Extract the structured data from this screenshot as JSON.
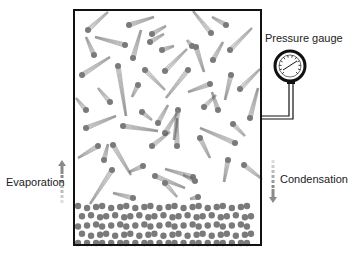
{
  "labels": {
    "pressure_gauge": "Pressure gauge",
    "evaporation": "Evaporation",
    "condensation": "Condensation"
  },
  "colors": {
    "molecule": "#7a7a7a",
    "outline": "#111111",
    "trail": "#555555",
    "arrow": "#8a8a8a",
    "background": "#ffffff"
  },
  "container": {
    "x": 74,
    "y": 10,
    "width": 187,
    "height": 235
  },
  "gauge": {
    "cx": 290,
    "cy": 66,
    "r": 15,
    "pipe_x": 291,
    "pipe_bottom_y": 118
  },
  "arrows": {
    "evaporation": {
      "x": 62,
      "y_top": 160,
      "y_bottom": 208,
      "direction": "up"
    },
    "condensation": {
      "x": 273,
      "y_top": 153,
      "y_bottom": 203,
      "direction": "down"
    }
  },
  "vapor_molecules": [
    {
      "x": 88,
      "y": 30,
      "dx": 20,
      "dy": -18
    },
    {
      "x": 129,
      "y": 25,
      "dx": 25,
      "dy": -8
    },
    {
      "x": 152,
      "y": 34,
      "dx": 14,
      "dy": -8
    },
    {
      "x": 150,
      "y": 42,
      "dx": 14,
      "dy": -8
    },
    {
      "x": 211,
      "y": 33,
      "dx": -18,
      "dy": -22
    },
    {
      "x": 226,
      "y": 25,
      "dx": -14,
      "dy": -8
    },
    {
      "x": 94,
      "y": 55,
      "dx": -8,
      "dy": -18
    },
    {
      "x": 125,
      "y": 45,
      "dx": -30,
      "dy": -8
    },
    {
      "x": 133,
      "y": 58,
      "dx": 8,
      "dy": -28
    },
    {
      "x": 162,
      "y": 50,
      "dx": 12,
      "dy": -4
    },
    {
      "x": 192,
      "y": 46,
      "dx": -5,
      "dy": -6
    },
    {
      "x": 165,
      "y": 71,
      "dx": 22,
      "dy": -22
    },
    {
      "x": 196,
      "y": 47,
      "dx": 8,
      "dy": 25
    },
    {
      "x": 213,
      "y": 60,
      "dx": 10,
      "dy": -18
    },
    {
      "x": 230,
      "y": 50,
      "dx": 22,
      "dy": -22
    },
    {
      "x": 82,
      "y": 75,
      "dx": 28,
      "dy": -18
    },
    {
      "x": 118,
      "y": 66,
      "dx": 8,
      "dy": 50
    },
    {
      "x": 145,
      "y": 70,
      "dx": 20,
      "dy": 20
    },
    {
      "x": 188,
      "y": 70,
      "dx": -22,
      "dy": 28
    },
    {
      "x": 210,
      "y": 84,
      "dx": -22,
      "dy": 8
    },
    {
      "x": 231,
      "y": 75,
      "dx": -6,
      "dy": 25
    },
    {
      "x": 240,
      "y": 89,
      "dx": 20,
      "dy": -20
    },
    {
      "x": 138,
      "y": 85,
      "dx": -6,
      "dy": 12
    },
    {
      "x": 110,
      "y": 102,
      "dx": -12,
      "dy": -14
    },
    {
      "x": 86,
      "y": 110,
      "dx": -10,
      "dy": -12
    },
    {
      "x": 142,
      "y": 112,
      "dx": 10,
      "dy": 8
    },
    {
      "x": 158,
      "y": 123,
      "dx": 10,
      "dy": -18
    },
    {
      "x": 178,
      "y": 110,
      "dx": -4,
      "dy": 30
    },
    {
      "x": 204,
      "y": 107,
      "dx": 12,
      "dy": -12
    },
    {
      "x": 218,
      "y": 110,
      "dx": -6,
      "dy": -18
    },
    {
      "x": 250,
      "y": 118,
      "dx": 8,
      "dy": -30
    },
    {
      "x": 86,
      "y": 128,
      "dx": 30,
      "dy": -12
    },
    {
      "x": 123,
      "y": 126,
      "dx": 35,
      "dy": 5
    },
    {
      "x": 165,
      "y": 133,
      "dx": 12,
      "dy": -20
    },
    {
      "x": 233,
      "y": 124,
      "dx": 12,
      "dy": 12
    },
    {
      "x": 235,
      "y": 143,
      "dx": -35,
      "dy": -15
    },
    {
      "x": 152,
      "y": 146,
      "dx": 18,
      "dy": -14
    },
    {
      "x": 177,
      "y": 146,
      "dx": 0,
      "dy": -28
    },
    {
      "x": 200,
      "y": 138,
      "dx": 10,
      "dy": 20
    },
    {
      "x": 98,
      "y": 146,
      "dx": -20,
      "dy": 12
    },
    {
      "x": 113,
      "y": 145,
      "dx": 18,
      "dy": 30
    },
    {
      "x": 104,
      "y": 160,
      "dx": 4,
      "dy": -16
    },
    {
      "x": 143,
      "y": 166,
      "dx": -14,
      "dy": 6
    },
    {
      "x": 155,
      "y": 176,
      "dx": 30,
      "dy": 12
    },
    {
      "x": 193,
      "y": 177,
      "dx": -28,
      "dy": -8
    },
    {
      "x": 228,
      "y": 160,
      "dx": -4,
      "dy": 22
    },
    {
      "x": 244,
      "y": 165,
      "dx": 18,
      "dy": 14
    },
    {
      "x": 112,
      "y": 170,
      "dx": -22,
      "dy": 34
    },
    {
      "x": 165,
      "y": 183,
      "dx": 12,
      "dy": 14
    },
    {
      "x": 195,
      "y": 181,
      "dx": -12,
      "dy": -6
    },
    {
      "x": 133,
      "y": 198,
      "dx": -20,
      "dy": -5
    },
    {
      "x": 198,
      "y": 197,
      "dx": -8,
      "dy": 2
    }
  ],
  "liquid": {
    "y_top": 207,
    "y_bottom": 244,
    "rows": 5,
    "cols": 22
  }
}
